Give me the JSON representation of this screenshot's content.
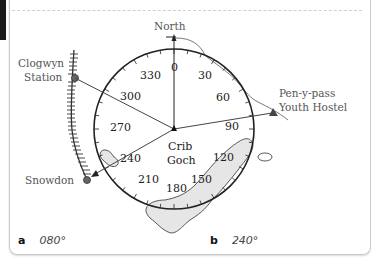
{
  "diagram": {
    "center_label_line1": "Crib",
    "center_label_line2": "Goch",
    "north_label": "North",
    "locations": {
      "clogwyn_line1": "Clogwyn",
      "clogwyn_line2": "Station",
      "penypass_line1": "Pen-y-pass",
      "penypass_line2": "Youth Hostel",
      "snowdon": "Snowdon"
    },
    "bearing_ticks": [
      "0",
      "30",
      "60",
      "90",
      "120",
      "150",
      "180",
      "210",
      "240",
      "270",
      "300",
      "330"
    ],
    "colors": {
      "line": "#222222",
      "label": "#555555",
      "lake_fill": "#e6e6e6"
    }
  },
  "answers": [
    {
      "letter": "a",
      "value": "080°"
    },
    {
      "letter": "b",
      "value": "240°"
    }
  ]
}
